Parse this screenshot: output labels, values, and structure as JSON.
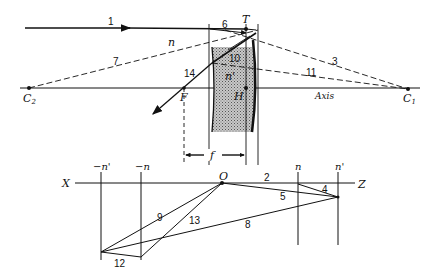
{
  "diagram": {
    "colors": {
      "ink": "#111111",
      "lens_fill": "#9a9a9a",
      "background": "#ffffff"
    },
    "top": {
      "points": {
        "C2": {
          "label": "C",
          "sub": "2"
        },
        "C1": {
          "label": "C",
          "sub": "1"
        },
        "F": "F",
        "H": "H",
        "T": "T"
      },
      "axis_label": "Axis",
      "medium_labels": {
        "n": "n",
        "n_prime": "n'"
      },
      "ray_labels": {
        "r1": "1",
        "r3": "3",
        "r6": "6",
        "r7": "7",
        "r10": "10",
        "r11": "11",
        "r14": "14"
      },
      "dimension_label": "f"
    },
    "bottom": {
      "axis_left": "X",
      "axis_right": "Z",
      "origin": "O",
      "vertical_labels": {
        "neg_n_prime": "−n'",
        "neg_n": "−n",
        "n": "n",
        "n_prime": "n'"
      },
      "line_labels": {
        "l2": "2",
        "l4": "4",
        "l5": "5",
        "l8": "8",
        "l9": "9",
        "l12": "12",
        "l13": "13"
      }
    }
  }
}
